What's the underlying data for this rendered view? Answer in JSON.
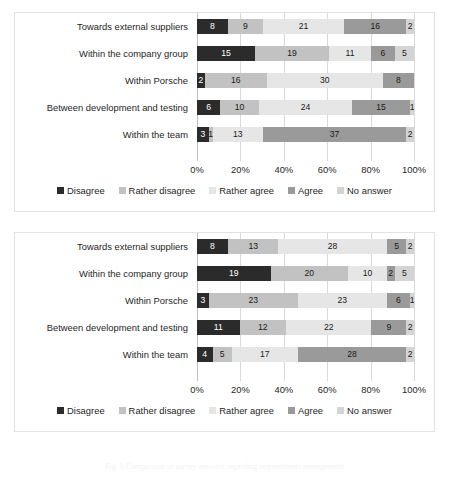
{
  "page": {
    "caption": "Fig. 9  Comparison of survey answers regarding requirements management"
  },
  "series_names": [
    "Disagree",
    "Rather disagree",
    "Rather agree",
    "Agree",
    "No answer"
  ],
  "series_colors": [
    "#2b2b2b",
    "#c2c2c2",
    "#e6e6e6",
    "#9a9a9a",
    "#d4d4d4"
  ],
  "xticks": [
    "0%",
    "20%",
    "40%",
    "60%",
    "80%",
    "100%"
  ],
  "categories": [
    "Towards external suppliers",
    "Within the company group",
    "Within Porsche",
    "Between development and testing",
    "Within the team"
  ],
  "chart_data": [
    {
      "type": "bar",
      "orientation": "horizontal",
      "stacked": true,
      "normalized": true,
      "title": "",
      "xlabel": "",
      "ylabel": "",
      "xlim": [
        0,
        100
      ],
      "grid": true,
      "legend_position": "bottom",
      "xticks": [
        "0%",
        "20%",
        "40%",
        "60%",
        "80%",
        "100%"
      ],
      "categories": [
        "Towards external suppliers",
        "Within the company group",
        "Within Porsche",
        "Between development and testing",
        "Within the team"
      ],
      "series": [
        {
          "name": "Disagree",
          "values": [
            8,
            15,
            2,
            6,
            3
          ]
        },
        {
          "name": "Rather disagree",
          "values": [
            9,
            19,
            16,
            10,
            1
          ]
        },
        {
          "name": "Rather agree",
          "values": [
            21,
            11,
            30,
            24,
            13
          ]
        },
        {
          "name": "Agree",
          "values": [
            16,
            6,
            8,
            15,
            37
          ]
        },
        {
          "name": "No answer",
          "values": [
            2,
            5,
            0,
            1,
            2
          ]
        }
      ]
    },
    {
      "type": "bar",
      "orientation": "horizontal",
      "stacked": true,
      "normalized": true,
      "title": "",
      "xlabel": "",
      "ylabel": "",
      "xlim": [
        0,
        100
      ],
      "grid": true,
      "legend_position": "bottom",
      "xticks": [
        "0%",
        "20%",
        "40%",
        "60%",
        "80%",
        "100%"
      ],
      "categories": [
        "Towards external suppliers",
        "Within the company group",
        "Within Porsche",
        "Between development and testing",
        "Within the team"
      ],
      "series": [
        {
          "name": "Disagree",
          "values": [
            8,
            19,
            3,
            11,
            4
          ]
        },
        {
          "name": "Rather disagree",
          "values": [
            13,
            20,
            23,
            12,
            5
          ]
        },
        {
          "name": "Rather agree",
          "values": [
            28,
            10,
            23,
            22,
            17
          ]
        },
        {
          "name": "Agree",
          "values": [
            5,
            2,
            6,
            9,
            28
          ]
        },
        {
          "name": "No answer",
          "values": [
            2,
            5,
            1,
            2,
            2
          ]
        }
      ]
    }
  ]
}
